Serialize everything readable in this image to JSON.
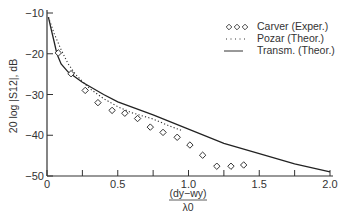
{
  "chart_data": {
    "type": "line",
    "title": "",
    "xlabel": "(d_y - w_y) / λ0",
    "xlabel_numerator": "(dy−wy)",
    "xlabel_denominator": "λ0",
    "ylabel": "20 log |S12|, dB",
    "xlim": [
      0,
      2.0
    ],
    "ylim": [
      -50,
      -10
    ],
    "x_ticks": [
      0,
      0.25,
      0.5,
      0.75,
      1.0,
      1.25,
      1.5,
      1.75,
      2.0
    ],
    "x_tick_labels": [
      {
        "value": 0,
        "label": "0"
      },
      {
        "value": 0.5,
        "label": "0.5"
      },
      {
        "value": 1.0,
        "label": "1.0"
      },
      {
        "value": 1.5,
        "label": "1.5"
      },
      {
        "value": 2.0,
        "label": "2.0"
      }
    ],
    "y_ticks": [
      {
        "value": -10,
        "label": "−10"
      },
      {
        "value": -20,
        "label": "−20"
      },
      {
        "value": -30,
        "label": "−30"
      },
      {
        "value": -40,
        "label": "−40"
      },
      {
        "value": -50,
        "label": "−50"
      }
    ],
    "grid": false,
    "legend_position": "top-right",
    "series": [
      {
        "name": "Carver (Exper.)",
        "style": "diamond-markers",
        "legend_symbol": "◇◇◇",
        "x": [
          0.08,
          0.17,
          0.27,
          0.36,
          0.46,
          0.55,
          0.64,
          0.73,
          0.82,
          0.92,
          1.01,
          1.1,
          1.2,
          1.3,
          1.39
        ],
        "y": [
          -19.8,
          -24.9,
          -29.0,
          -32.0,
          -33.9,
          -34.6,
          -35.9,
          -38.0,
          -39.3,
          -40.5,
          -42.4,
          -44.9,
          -47.6,
          -47.6,
          -47.3
        ]
      },
      {
        "name": "Pozar (Theor.)",
        "style": "dotted",
        "legend_symbol": "....",
        "x": [
          0.01,
          0.05,
          0.1,
          0.15,
          0.2,
          0.3,
          0.4,
          0.5,
          0.6,
          0.75,
          0.85,
          0.95
        ],
        "y": [
          -11,
          -15,
          -19,
          -22.5,
          -25,
          -28.5,
          -31,
          -33,
          -34.5,
          -36,
          -37.5,
          -38.8
        ]
      },
      {
        "name": "Transm. (Theor.)",
        "style": "solid",
        "legend_symbol": "——",
        "x": [
          0.01,
          0.03,
          0.05,
          0.07,
          0.1,
          0.15,
          0.25,
          0.4,
          0.5,
          0.75,
          1.0,
          1.25,
          1.5,
          1.75,
          2.0
        ],
        "y": [
          -11,
          -14,
          -17,
          -20,
          -22.5,
          -24.5,
          -27,
          -30,
          -31.8,
          -35,
          -38.5,
          -42,
          -44.5,
          -47,
          -49
        ]
      }
    ]
  }
}
